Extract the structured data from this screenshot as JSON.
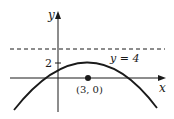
{
  "diagram": {
    "type": "function-graph",
    "axes": {
      "x_label": "x",
      "y_label": "y",
      "y_tick_label": "2"
    },
    "asymptote_label": "y = 4",
    "point_label": "(3, 0)",
    "curve": "downward parabola with vertex near (3, 2)",
    "colors": {
      "ink": "#1a1a1a",
      "background": "#ffffff"
    }
  }
}
